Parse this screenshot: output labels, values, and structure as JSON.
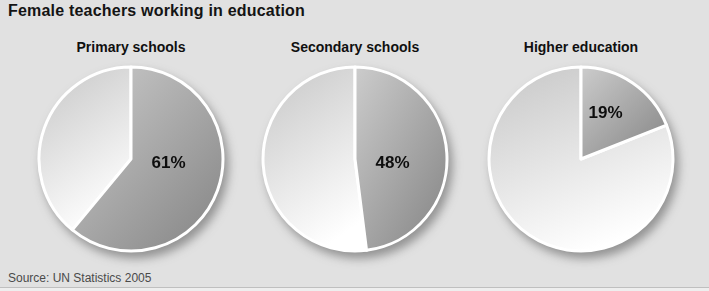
{
  "title": "Female teachers working in education",
  "source": "Source: UN Statistics 2005",
  "colors": {
    "background": "#e1e1e1",
    "female_slice_gradient_from": "#cccccc",
    "female_slice_gradient_to": "#878787",
    "remainder_slice_gradient_from": "#c9c9c9",
    "remainder_slice_gradient_to": "#ffffff",
    "slice_divider": "#ffffff",
    "label_text": "#0e0e0e"
  },
  "chart_data": [
    {
      "type": "pie",
      "title": "Primary schools",
      "categories": [
        "Female teachers",
        "Other"
      ],
      "values": [
        61,
        39
      ],
      "label": "61%",
      "start_angle_deg": 0,
      "direction": "clockwise",
      "legend": "none"
    },
    {
      "type": "pie",
      "title": "Secondary schools",
      "categories": [
        "Female teachers",
        "Other"
      ],
      "values": [
        48,
        52
      ],
      "label": "48%",
      "start_angle_deg": 0,
      "direction": "clockwise",
      "legend": "none"
    },
    {
      "type": "pie",
      "title": "Higher education",
      "categories": [
        "Female teachers",
        "Other"
      ],
      "values": [
        19,
        81
      ],
      "label": "19%",
      "start_angle_deg": 0,
      "direction": "clockwise",
      "legend": "none"
    }
  ]
}
